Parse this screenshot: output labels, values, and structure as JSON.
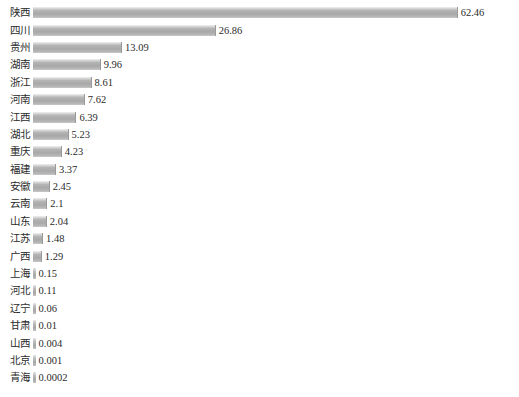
{
  "chart_data": {
    "type": "bar",
    "orientation": "horizontal",
    "title": "",
    "subtitle": "",
    "xlabel": "",
    "ylabel": "",
    "grid": false,
    "legend": null,
    "axis_visible": false,
    "xlim": [
      0,
      62.46
    ],
    "bar_color": "#ababab",
    "background_color": "#ffffff",
    "text_color": "#2b2b2b",
    "categories": [
      "陕西",
      "四川",
      "贵州",
      "湖南",
      "浙江",
      "河南",
      "江西",
      "湖北",
      "重庆",
      "福建",
      "安徽",
      "云南",
      "山东",
      "江苏",
      "广西",
      "上海",
      "河北",
      "辽宁",
      "甘肃",
      "山西",
      "北京",
      "青海"
    ],
    "values": [
      62.46,
      26.86,
      13.09,
      9.96,
      8.61,
      7.62,
      6.39,
      5.23,
      4.23,
      3.37,
      2.45,
      2.1,
      2.04,
      1.48,
      1.29,
      0.15,
      0.11,
      0.06,
      0.01,
      0.004,
      0.001,
      0.0002
    ],
    "value_labels": [
      "62.46",
      "26.86",
      "13.09",
      "9.96",
      "8.61",
      "7.62",
      "6.39",
      "5.23",
      "4.23",
      "3.37",
      "2.45",
      "2.1",
      "2.04",
      "1.48",
      "1.29",
      "0.15",
      "0.11",
      "0.06",
      "0.01",
      "0.004",
      "0.001",
      "0.0002"
    ]
  }
}
